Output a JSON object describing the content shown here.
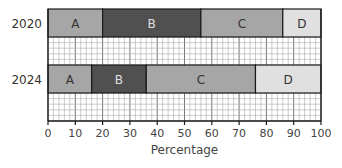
{
  "chart_data": {
    "type": "bar",
    "orientation": "horizontal",
    "stacked": true,
    "title": "",
    "xlabel": "Percentage",
    "ylabel": "",
    "xlim": [
      0,
      100
    ],
    "x_ticks": [
      0,
      10,
      20,
      30,
      40,
      50,
      60,
      70,
      80,
      90,
      100
    ],
    "categories": [
      "2020",
      "2024"
    ],
    "series": [
      {
        "name": "A",
        "values": [
          20,
          16
        ],
        "color": "#a6a6a6",
        "label_color": "#333333"
      },
      {
        "name": "B",
        "values": [
          36,
          20
        ],
        "color": "#505050",
        "label_color": "#e0e0e0"
      },
      {
        "name": "C",
        "values": [
          30,
          40
        ],
        "color": "#a6a6a6",
        "label_color": "#333333"
      },
      {
        "name": "D",
        "values": [
          14,
          24
        ],
        "color": "#e0e0e0",
        "label_color": "#333333"
      }
    ],
    "grid": "minor grid pattern between bars",
    "legend": "none (segments labeled inline)"
  }
}
